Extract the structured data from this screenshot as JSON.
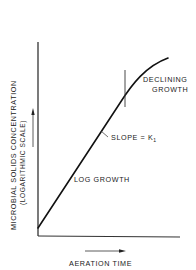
{
  "diagram": {
    "type": "growth-curve",
    "y_axis": {
      "label_line1": "MICROBIAL SOLIDS CONCENTRATION",
      "label_line2": "(LOGARITHMIC SCALE)"
    },
    "x_axis": {
      "label": "AERATION TIME"
    },
    "phases": [
      {
        "label": "LOG GROWTH"
      },
      {
        "label_line1": "DECLINING",
        "label_line2": "GROWTH"
      }
    ],
    "annotation": {
      "slope_label": "SLOPE = K",
      "slope_subscript": "1"
    },
    "colors": {
      "line": "#111111",
      "background": "#ffffff"
    }
  }
}
